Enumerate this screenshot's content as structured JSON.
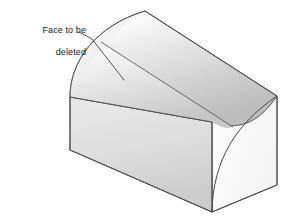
{
  "figure": {
    "annotation": {
      "line1": "Face to be",
      "line2": "deleted",
      "full_text": "Face to be deleted",
      "leader_from": [
        79,
        32
      ],
      "leader_elbow": [
        92,
        39
      ],
      "leader_to": [
        124,
        80
      ]
    },
    "colors": {
      "outline": "#4a4a4a",
      "tangent_edge": "#5a5a5a",
      "background": "#ffffff",
      "left_end_face_light": "#f7f7f7",
      "left_end_face_dark": "#c9c9c9",
      "curved_top_light": "#fdfdfd",
      "curved_top_mid": "#dcdcdc",
      "curved_top_dark": "#b9b9b9",
      "front_face_light": "#efefef",
      "front_face_dark": "#cfcfcf",
      "right_end_face": "#fbfbfb",
      "fillet_face": "#e8e8e8",
      "annotation_text": "#1a1a1a"
    },
    "geometry": {
      "apex_top": [
        145,
        11
      ],
      "back_right_corner": [
        277,
        96
      ],
      "right_bottom_corner": [
        277,
        185
      ],
      "front_bottom_corner": [
        212,
        212
      ],
      "left_bottom_corner": [
        70,
        150
      ],
      "left_edge_top": [
        70,
        97
      ],
      "front_waist_left": [
        70,
        97
      ],
      "front_waist_right": [
        212,
        122
      ],
      "tangent_edge_start": [
        101,
        42
      ],
      "tangent_edge_end": [
        233,
        127
      ]
    },
    "faces": [
      {
        "name": "left-end-face",
        "label": "Curved left end face"
      },
      {
        "name": "curved-top-face",
        "label": "Cylindrical top face"
      },
      {
        "name": "front-vertical-face",
        "label": "Front vertical face"
      },
      {
        "name": "right-end-face",
        "label": "Right end face"
      },
      {
        "name": "fillet-face",
        "label": "Rounded fillet face"
      }
    ]
  }
}
